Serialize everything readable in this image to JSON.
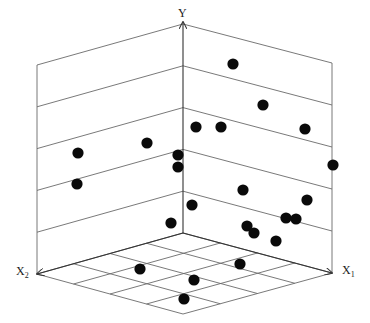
{
  "chart_data": {
    "type": "scatter",
    "subtype": "3d-scatter",
    "title": "",
    "axes": {
      "y": {
        "label": "Y"
      },
      "x1": {
        "label": "X",
        "subscript": "1"
      },
      "x2": {
        "label": "X",
        "subscript": "2"
      }
    },
    "grid": true,
    "legend": null,
    "geometry_px": {
      "origin": [
        183,
        233
      ],
      "y_top": [
        183,
        22
      ],
      "x1_end": [
        332,
        273
      ],
      "x2_end": [
        37,
        274
      ],
      "left_wall_top": [
        37,
        65
      ],
      "right_wall_top": [
        332,
        63
      ],
      "floor_front": [
        183,
        314
      ]
    },
    "points_px": [
      [
        233,
        64
      ],
      [
        263,
        105
      ],
      [
        305,
        129
      ],
      [
        196,
        127
      ],
      [
        221,
        127
      ],
      [
        147,
        143
      ],
      [
        78,
        153
      ],
      [
        178,
        155
      ],
      [
        178,
        167
      ],
      [
        333,
        165
      ],
      [
        77,
        184
      ],
      [
        243,
        190
      ],
      [
        192,
        205
      ],
      [
        307,
        200
      ],
      [
        171,
        223
      ],
      [
        247,
        226
      ],
      [
        254,
        233
      ],
      [
        286,
        218
      ],
      [
        296,
        219
      ],
      [
        276,
        241
      ],
      [
        140,
        269
      ],
      [
        240,
        264
      ],
      [
        194,
        280
      ],
      [
        184,
        299
      ]
    ],
    "point_count": 24,
    "point_color": "#0a0a0a",
    "line_color": "#6a6a6a"
  },
  "labels": {
    "y": "Y",
    "x1_main": "X",
    "x1_sub": "1",
    "x2_main": "X",
    "x2_sub": "2"
  }
}
